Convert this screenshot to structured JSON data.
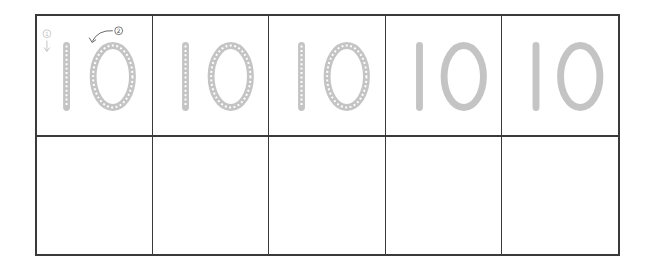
{
  "worksheet": {
    "title": "Number tracing practice: 10",
    "digit_text": "10",
    "stroke_guides": [
      {
        "number": "①",
        "label": "stroke 1",
        "direction": "down"
      },
      {
        "number": "②",
        "label": "stroke 2",
        "direction": "counter-clockwise"
      }
    ],
    "rows": [
      {
        "type": "trace",
        "cells": [
          {
            "content": "10",
            "style": "dotted",
            "has_guides": true
          },
          {
            "content": "10",
            "style": "dotted",
            "has_guides": false
          },
          {
            "content": "10",
            "style": "dotted",
            "has_guides": false
          },
          {
            "content": "10",
            "style": "solid",
            "has_guides": false
          },
          {
            "content": "10",
            "style": "solid",
            "has_guides": false
          }
        ]
      },
      {
        "type": "blank",
        "cells": [
          {
            "content": ""
          },
          {
            "content": ""
          },
          {
            "content": ""
          },
          {
            "content": ""
          },
          {
            "content": ""
          }
        ]
      }
    ],
    "colors": {
      "grid_line": "#3a3a3a",
      "glyph_gray": "#c4c4c4",
      "dot_white": "#ffffff",
      "guide_gray": "#bdbdbd",
      "guide_dark": "#555555"
    }
  }
}
